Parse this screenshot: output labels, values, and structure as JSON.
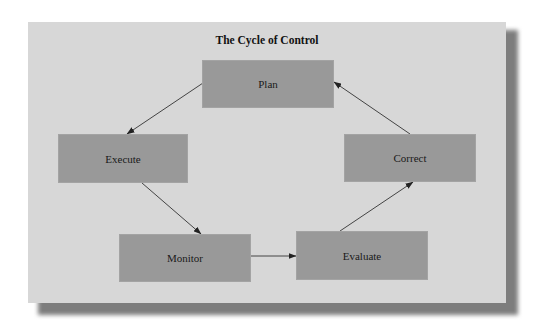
{
  "diagram": {
    "title": "The Cycle of Control",
    "nodes": [
      {
        "id": "plan",
        "label": "Plan"
      },
      {
        "id": "execute",
        "label": "Execute"
      },
      {
        "id": "monitor",
        "label": "Monitor"
      },
      {
        "id": "evaluate",
        "label": "Evaluate"
      },
      {
        "id": "correct",
        "label": "Correct"
      }
    ],
    "edges": [
      {
        "from": "plan",
        "to": "execute"
      },
      {
        "from": "execute",
        "to": "monitor"
      },
      {
        "from": "monitor",
        "to": "evaluate"
      },
      {
        "from": "evaluate",
        "to": "correct"
      },
      {
        "from": "correct",
        "to": "plan"
      }
    ],
    "colors": {
      "panel": "#d7d7d7",
      "box": "#999999",
      "arrow": "#333333",
      "shadow": "#7d7d7d"
    }
  }
}
